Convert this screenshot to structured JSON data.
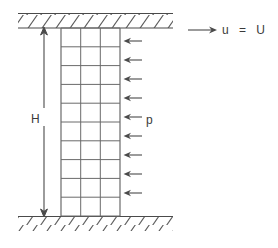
{
  "figure": {
    "background_color": "#ffffff",
    "line_color": "#4a4a4a",
    "text_color": "#3a3a3a",
    "width": 278,
    "height": 248
  },
  "labels": {
    "height_symbol": "H",
    "pressure_symbol": "p",
    "velocity_condition": "u  =  U"
  },
  "walls": {
    "top": {
      "name": "upper-wall",
      "x": 18,
      "y": 13,
      "width": 155,
      "height": 15,
      "hatch_direction": "forward-slash",
      "hatch_count": 11,
      "has_top_border": true,
      "has_bottom_border": true
    },
    "bottom": {
      "name": "lower-wall",
      "x": 18,
      "y": 216,
      "width": 155,
      "height": 15,
      "hatch_direction": "forward-slash",
      "hatch_count": 11,
      "has_top_border": true,
      "has_bottom_border": false
    }
  },
  "mesh": {
    "name": "computational-grid",
    "x": 61,
    "y": 28,
    "width": 59,
    "height": 188,
    "columns": 3,
    "rows": 10,
    "column_width": 19.67,
    "row_height": 18.8
  },
  "dimension_line": {
    "name": "height-dimension",
    "x": 44,
    "y_top": 28,
    "y_bottom": 216,
    "arrowheads": "both",
    "label_gap_top": 108,
    "label_gap_bottom": 126
  },
  "pressure_arrows": {
    "name": "pressure-load-arrows",
    "count": 9,
    "direction": "left",
    "tip_x": 124,
    "tail_x": 142,
    "y_positions": [
      41,
      60,
      79,
      98,
      117,
      136,
      155,
      174,
      193
    ]
  },
  "velocity_arrow": {
    "name": "wall-velocity-arrow",
    "direction": "right",
    "x_start": 188,
    "x_end": 216,
    "y": 30
  }
}
